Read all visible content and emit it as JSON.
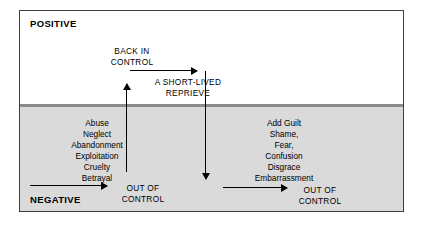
{
  "diagram": {
    "zones": {
      "positive_label": "POSITIVE",
      "negative_label": "NEGATIVE"
    },
    "colors": {
      "negative_fill": "#dadada",
      "positive_fill": "#ffffff",
      "divider": "#8c8c8c",
      "border": "#3d3d3d",
      "ink": "#000000"
    },
    "left_list": {
      "items": [
        "Abuse",
        "Neglect",
        "Abandonment",
        "Exploitation",
        "Cruelty",
        "Betrayal"
      ]
    },
    "right_list": {
      "items": [
        "Add Guilt",
        "Shame,",
        "Fear,",
        "Confusion",
        "Disgrace",
        "Embarrassment"
      ]
    },
    "annotations": {
      "back_in_control": "BACK IN\nCONTROL",
      "short_lived_reprieve": "A SHORT-LIVED\nREPRIEVE",
      "out_of_control_left": "OUT OF\nCONTROL",
      "out_of_control_right": "OUT OF\nCONTROL"
    },
    "arrows": [
      {
        "name": "bottom-left-progression",
        "direction": "right"
      },
      {
        "name": "back-in-control-progression",
        "direction": "right"
      },
      {
        "name": "bottom-right-progression",
        "direction": "right"
      },
      {
        "name": "recovery-rise",
        "direction": "up"
      },
      {
        "name": "relapse-fall",
        "direction": "down"
      }
    ]
  }
}
